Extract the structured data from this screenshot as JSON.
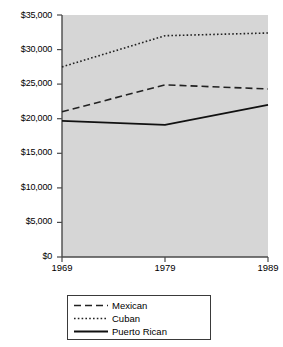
{
  "chart_data": {
    "type": "line",
    "title": "",
    "subtitle": "",
    "xlabel": "",
    "ylabel": "",
    "x": [
      "1969",
      "1979",
      "1989"
    ],
    "categories": [
      "1969",
      "1979",
      "1989"
    ],
    "xtick_labels": [
      "1969",
      "1979",
      "1989"
    ],
    "ytick_labels": [
      "$35,000",
      "$30,000",
      "$25,000",
      "$20,000",
      "$15,000",
      "$10,000",
      "$5,000",
      "$0"
    ],
    "ytick_values": [
      35000,
      30000,
      25000,
      20000,
      15000,
      10000,
      5000,
      0
    ],
    "ylim": [
      0,
      35000
    ],
    "grid": false,
    "legend_position": "bottom",
    "plot_background": "#d6d6d6",
    "axis_color": "#4a4a4a",
    "series": [
      {
        "name": "Mexican",
        "style": "dashed",
        "color": "#222222",
        "values": [
          21000,
          24900,
          24300
        ]
      },
      {
        "name": "Cuban",
        "style": "dotted",
        "color": "#222222",
        "values": [
          27500,
          32000,
          32400
        ]
      },
      {
        "name": "Puerto Rican",
        "style": "solid",
        "color": "#111111",
        "values": [
          19700,
          19100,
          22000
        ]
      }
    ]
  },
  "axis": {
    "y_ticks": [
      {
        "label": "$35,000",
        "value": 35000
      },
      {
        "label": "$30,000",
        "value": 30000
      },
      {
        "label": "$25,000",
        "value": 25000
      },
      {
        "label": "$20,000",
        "value": 20000
      },
      {
        "label": "$15,000",
        "value": 15000
      },
      {
        "label": "$10,000",
        "value": 10000
      },
      {
        "label": "$5,000",
        "value": 5000
      },
      {
        "label": "$0",
        "value": 0
      }
    ],
    "x_ticks": [
      {
        "label": "1969"
      },
      {
        "label": "1979"
      },
      {
        "label": "1989"
      }
    ]
  },
  "legend": {
    "items": [
      {
        "label": "Mexican",
        "style": "dashed"
      },
      {
        "label": "Cuban",
        "style": "dotted"
      },
      {
        "label": "Puerto Rican",
        "style": "solid"
      }
    ]
  }
}
